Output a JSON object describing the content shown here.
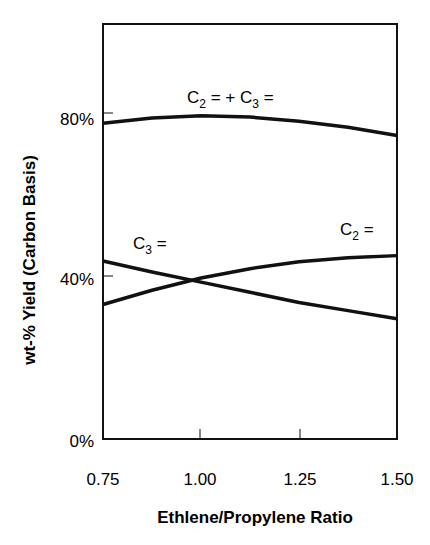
{
  "chart_data": {
    "type": "line",
    "title": "",
    "xlabel": "Ethlene/Propylene Ratio",
    "ylabel": "wt-% Yield (Carbon Basis)",
    "x": [
      0.75,
      0.875,
      1.0,
      1.125,
      1.25,
      1.375,
      1.5
    ],
    "x_tick_labels": [
      "0.75",
      "1.00",
      "1.25",
      "1.50"
    ],
    "y_tick_labels": [
      "0%",
      "40%",
      "80%"
    ],
    "xlim": [
      0.75,
      1.5
    ],
    "ylim": [
      0,
      100
    ],
    "grid": false,
    "legend": "inline labels",
    "series": [
      {
        "name": "C2= + C3=",
        "values": [
          77.5,
          78.8,
          79.3,
          79.0,
          78.0,
          76.5,
          74.5
        ]
      },
      {
        "name": "C2=",
        "values": [
          33.0,
          36.5,
          39.5,
          41.8,
          43.5,
          44.5,
          45.0
        ]
      },
      {
        "name": "C3=",
        "values": [
          43.7,
          41.0,
          38.5,
          36.0,
          33.5,
          31.5,
          29.5
        ]
      }
    ],
    "annotations": [
      "C2 = + C3 =",
      "C3 =",
      "C2 ="
    ]
  },
  "labels": {
    "xlabel": "Ethlene/Propylene Ratio",
    "ylabel": "wt-% Yield (Carbon Basis)",
    "xticks": [
      "0.75",
      "1.00",
      "1.25",
      "1.50"
    ],
    "yticks": [
      "0%",
      "40%",
      "80%"
    ]
  }
}
